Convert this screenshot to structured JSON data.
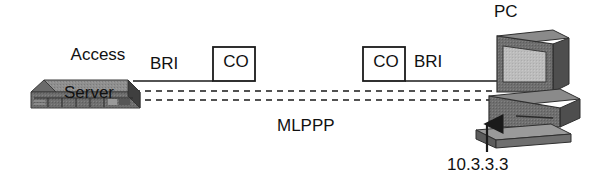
{
  "diagram": {
    "title_hidden": "",
    "nodes": {
      "access_server": {
        "label_line1": "Access",
        "label_line2": "Server",
        "icon": "rack-server-icon"
      },
      "co_left": {
        "label": "CO",
        "icon": "central-office-box-icon"
      },
      "co_right": {
        "label": "CO",
        "icon": "central-office-box-icon"
      },
      "pc": {
        "label": "PC",
        "icon": "desktop-computer-icon"
      }
    },
    "links": {
      "bri_left": "BRI",
      "bri_right": "BRI",
      "tunnel": "MLPPP"
    },
    "annotations": {
      "pc_ip": "10.3.3.3",
      "pointer": "up-arrow-icon"
    },
    "colors": {
      "line": "#1a1a1a",
      "text": "#111111",
      "device_top": "#8c8c8c",
      "device_front": "#6e6e6e",
      "device_side": "#4a4a4a",
      "screen": "#b9b9b9",
      "background": "#ffffff"
    }
  }
}
